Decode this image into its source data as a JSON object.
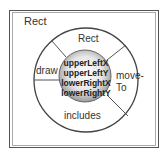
{
  "diagram": {
    "title": "Rect",
    "methods": {
      "top": "Rect",
      "left": "draw",
      "right_line1": "move-",
      "right_line2": "To",
      "bottom": "includes"
    },
    "data_fields": [
      "upperLeftX",
      "upperLeftY",
      "lowerRightX",
      "lowerRightY"
    ],
    "colors": {
      "border": "#444444",
      "ring_fill": "#ffffff",
      "core_center": "#ffffff",
      "core_edge": "#9a9a9a"
    }
  }
}
